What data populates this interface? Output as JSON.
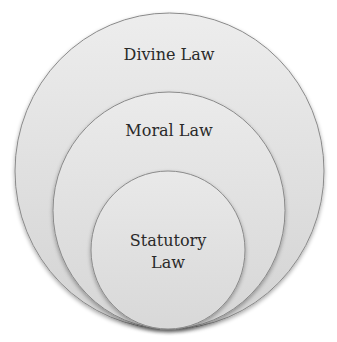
{
  "diagram": {
    "type": "nested-circles",
    "colors": {
      "background": "#ffffff",
      "fill_top": "#ececec",
      "fill_bottom": "#d2d2d2",
      "stroke": "#8a8a8a",
      "text": "#2a2a2a"
    },
    "circles": [
      {
        "id": "outer",
        "label": "Divine Law"
      },
      {
        "id": "middle",
        "label": "Moral Law"
      },
      {
        "id": "inner",
        "label_line1": "Statutory",
        "label_line2": "Law"
      }
    ]
  }
}
